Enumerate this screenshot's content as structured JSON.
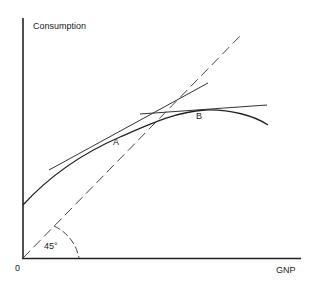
{
  "diagram": {
    "type": "economics-consumption-function",
    "axes": {
      "y_label": "Consumption",
      "x_label": "GNP",
      "origin_label": "0"
    },
    "lines": [
      {
        "name": "45-degree line",
        "style": "dashed"
      },
      {
        "name": "consumption curve",
        "style": "solid",
        "shape": "concave, rising then falling"
      },
      {
        "name": "tangent at A",
        "style": "solid"
      },
      {
        "name": "tangent at B",
        "style": "solid",
        "slope": "near zero"
      }
    ],
    "points": [
      {
        "label": "A"
      },
      {
        "label": "B"
      }
    ],
    "angle_label": "45°"
  }
}
